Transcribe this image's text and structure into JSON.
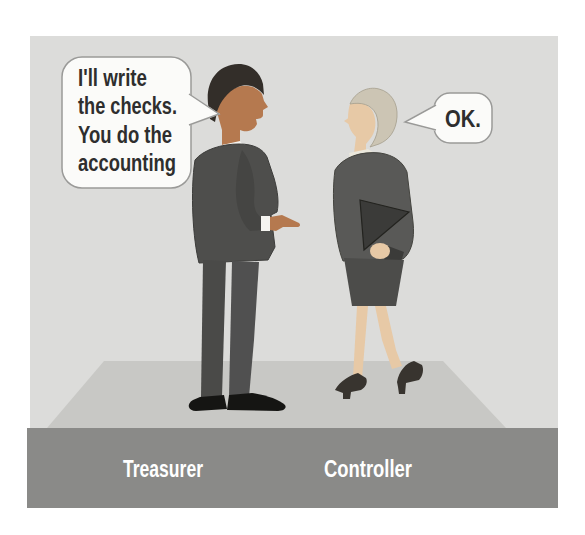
{
  "illustration": {
    "speech": {
      "treasurer": {
        "lines": [
          "I'll write",
          "the checks.",
          "You do the",
          "accounting"
        ]
      },
      "controller": {
        "text": "OK."
      }
    },
    "labels": {
      "treasurer": "Treasurer",
      "controller": "Controller"
    },
    "colors": {
      "page_bg": "#ffffff",
      "panel_bg": "#dcdcda",
      "floor": "#c8c8c5",
      "label_bar": "#8a8a88",
      "label_text": "#ffffff",
      "bubble_fill": "#fbfbf9",
      "bubble_border": "#9a9a98",
      "bubble_text": "#2e2e2e",
      "man_suit": "#4e4e4c",
      "man_skin": "#b5794f",
      "man_hair": "#332e29",
      "man_shirt": "#f5f4f0",
      "man_shoes": "#151513",
      "woman_jacket": "#595957",
      "woman_skirt": "#4c4c4a",
      "woman_skin": "#e7c9a6",
      "woman_hair": "#ccc5b4",
      "woman_collar": "#ebe8dc",
      "woman_folder": "#3b3b39",
      "woman_shoes": "#38342f"
    }
  }
}
